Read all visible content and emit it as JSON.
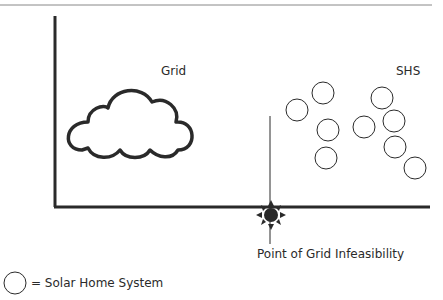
{
  "diagram": {
    "grid_label": "Grid",
    "shs_label": "SHS",
    "point_label": "Point of Grid Infeasibility",
    "legend": {
      "symbol": "circle",
      "text": "= Solar Home System"
    },
    "colors": {
      "stroke": "#2a2a2a",
      "top_rule": "#888888"
    },
    "shs_circles": [
      {
        "cx": 297,
        "cy": 110
      },
      {
        "cx": 323,
        "cy": 93
      },
      {
        "cx": 328,
        "cy": 130
      },
      {
        "cx": 326,
        "cy": 158
      },
      {
        "cx": 364,
        "cy": 127
      },
      {
        "cx": 382,
        "cy": 98
      },
      {
        "cx": 394,
        "cy": 121
      },
      {
        "cx": 395,
        "cy": 147
      },
      {
        "cx": 415,
        "cy": 168
      }
    ]
  }
}
